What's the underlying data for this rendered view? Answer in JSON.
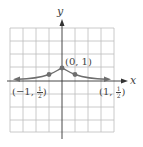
{
  "figure": {
    "type": "function-graph",
    "x_axis_label": "x",
    "y_axis_label": "y",
    "grid": {
      "cols": 8,
      "rows": 8,
      "cell_px": 13
    },
    "colors": {
      "grid": "#bdbdbd",
      "axis": "#333333",
      "curve": "#6e6e6e",
      "point": "#6e6e6e",
      "text": "#444444"
    },
    "points": [
      {
        "x": -1,
        "y": 0.5,
        "label": "(−1, ½)"
      },
      {
        "x": 0,
        "y": 1,
        "label": "(0, 1)"
      },
      {
        "x": 1,
        "y": 0.5,
        "label": "(1, ½)"
      }
    ],
    "labels": {
      "peak": "(0, 1)",
      "left_prefix": "(−1, ",
      "left_suffix": ")",
      "right_prefix": "(1, ",
      "right_suffix": ")",
      "half_num": "1",
      "half_den": "2"
    }
  }
}
